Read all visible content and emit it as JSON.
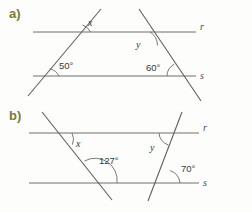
{
  "figure": {
    "background_color": "#fdfdfb",
    "line_color": "#6e6e6e",
    "label_color": "#7b7a34",
    "text_color": "#3a3a3a"
  },
  "parts": [
    {
      "id": "a",
      "label": "a)",
      "parallel_lines": [
        {
          "name": "r"
        },
        {
          "name": "s"
        }
      ],
      "angles": [
        {
          "id": "a-x",
          "text": "x",
          "kind": "variable"
        },
        {
          "id": "a-50",
          "text": "50°",
          "kind": "measure"
        },
        {
          "id": "a-y",
          "text": "y",
          "kind": "variable"
        },
        {
          "id": "a-60",
          "text": "60°",
          "kind": "measure"
        }
      ]
    },
    {
      "id": "b",
      "label": "b)",
      "parallel_lines": [
        {
          "name": "r"
        },
        {
          "name": "s"
        }
      ],
      "angles": [
        {
          "id": "b-x",
          "text": "x",
          "kind": "variable"
        },
        {
          "id": "b-127",
          "text": "127°",
          "kind": "measure"
        },
        {
          "id": "b-y",
          "text": "y",
          "kind": "variable"
        },
        {
          "id": "b-70",
          "text": "70°",
          "kind": "measure"
        }
      ]
    }
  ]
}
